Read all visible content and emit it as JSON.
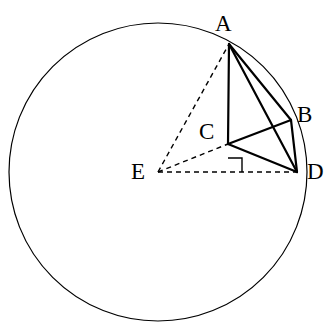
{
  "figure": {
    "width": 334,
    "height": 330,
    "background_color": "#ffffff",
    "stroke_color": "#000000"
  },
  "circle": {
    "name": "main-circle",
    "center_label": "E",
    "center_x": 158,
    "center_y": 172,
    "radius": 149,
    "stroke_width": 1.2,
    "style": "solid"
  },
  "points": [
    {
      "id": "A",
      "label": "A",
      "x": 229,
      "y": 44,
      "label_x": 215,
      "label_y": 12,
      "on_circle": true
    },
    {
      "id": "B",
      "label": "B",
      "x": 291,
      "y": 120,
      "label_x": 297,
      "label_y": 103,
      "on_circle": true
    },
    {
      "id": "C",
      "label": "C",
      "x": 228,
      "y": 144,
      "label_x": 199,
      "label_y": 120,
      "on_circle": false
    },
    {
      "id": "D",
      "label": "D",
      "x": 297,
      "y": 172,
      "label_x": 307,
      "label_y": 160,
      "on_circle": true
    },
    {
      "id": "E",
      "label": "E",
      "x": 158,
      "y": 172,
      "label_x": 131,
      "label_y": 160,
      "on_circle": false
    }
  ],
  "segments": [
    {
      "id": "AC",
      "from": "A",
      "to": "C",
      "x1": 229,
      "y1": 44,
      "x2": 228,
      "y2": 144,
      "style": "solid",
      "stroke_width": 2.2
    },
    {
      "id": "AB",
      "from": "A",
      "to": "B",
      "x1": 229,
      "y1": 44,
      "x2": 291,
      "y2": 120,
      "style": "solid",
      "stroke_width": 2.2
    },
    {
      "id": "AD",
      "from": "A",
      "to": "D",
      "x1": 229,
      "y1": 44,
      "x2": 297,
      "y2": 172,
      "style": "solid",
      "stroke_width": 2.2
    },
    {
      "id": "CB",
      "from": "C",
      "to": "B",
      "x1": 228,
      "y1": 144,
      "x2": 291,
      "y2": 120,
      "style": "solid",
      "stroke_width": 2.2
    },
    {
      "id": "CD",
      "from": "C",
      "to": "D",
      "x1": 228,
      "y1": 144,
      "x2": 297,
      "y2": 172,
      "style": "solid",
      "stroke_width": 2.2
    },
    {
      "id": "BD",
      "from": "B",
      "to": "D",
      "x1": 291,
      "y1": 120,
      "x2": 297,
      "y2": 172,
      "style": "solid",
      "stroke_width": 2.2
    },
    {
      "id": "EA",
      "from": "E",
      "to": "A",
      "x1": 158,
      "y1": 172,
      "x2": 229,
      "y2": 44,
      "style": "dashed",
      "stroke_width": 1.4
    },
    {
      "id": "EC",
      "from": "E",
      "to": "C",
      "x1": 158,
      "y1": 172,
      "x2": 228,
      "y2": 144,
      "style": "dashed",
      "stroke_width": 1.4
    },
    {
      "id": "ED",
      "from": "E",
      "to": "D",
      "x1": 158,
      "y1": 172,
      "x2": 297,
      "y2": 172,
      "style": "dashed",
      "stroke_width": 1.4
    }
  ],
  "right_angle_marker": {
    "id": "right-angle-at-C",
    "vertex": "C",
    "size": 14,
    "path": "M 228 158 L 242 158 L 242 172",
    "stroke_width": 1.4
  },
  "dash_pattern": "5 4"
}
